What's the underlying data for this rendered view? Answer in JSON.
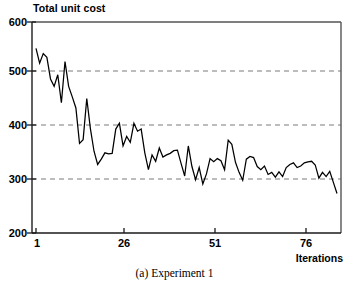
{
  "chart_data": {
    "type": "line",
    "title": "Total unit cost",
    "xlabel": "Iterations",
    "ylabel": "",
    "caption": "(a) Experiment 1",
    "xlim": [
      1,
      84
    ],
    "ylim": [
      200,
      600
    ],
    "yticks": [
      200,
      300,
      400,
      500,
      600
    ],
    "xticks": [
      1,
      26,
      51,
      76
    ],
    "grid": "horizontal-dashed at 300, 400, 500",
    "legend": "none",
    "line_color": "#000000",
    "series": [
      {
        "name": "Total unit cost",
        "x": [
          1,
          2,
          3,
          4,
          5,
          6,
          7,
          8,
          9,
          10,
          11,
          12,
          13,
          14,
          15,
          16,
          17,
          18,
          19,
          20,
          21,
          22,
          23,
          24,
          25,
          26,
          27,
          28,
          29,
          30,
          31,
          32,
          33,
          34,
          35,
          36,
          37,
          38,
          39,
          40,
          41,
          42,
          43,
          44,
          45,
          46,
          47,
          48,
          49,
          50,
          51,
          52,
          53,
          54,
          55,
          56,
          57,
          58,
          59,
          60,
          61,
          62,
          63,
          64,
          65,
          66,
          67,
          68,
          69,
          70,
          71,
          72,
          73,
          74,
          75,
          76,
          77,
          78,
          79,
          80,
          81,
          82,
          83,
          84
        ],
        "values": [
          550,
          522,
          540,
          533,
          492,
          478,
          500,
          447,
          525,
          478,
          458,
          437,
          370,
          377,
          455,
          398,
          355,
          330,
          340,
          352,
          350,
          351,
          397,
          408,
          365,
          383,
          372,
          408,
          393,
          397,
          352,
          320,
          348,
          336,
          361,
          344,
          348,
          351,
          356,
          357,
          332,
          308,
          365,
          326,
          301,
          324,
          293,
          312,
          341,
          335,
          341,
          337,
          320,
          376,
          368,
          334,
          315,
          300,
          340,
          345,
          343,
          326,
          320,
          327,
          311,
          315,
          306,
          316,
          307,
          324,
          330,
          333,
          324,
          327,
          333,
          335,
          336,
          329,
          304,
          315,
          307,
          317,
          296,
          275
        ]
      }
    ]
  }
}
